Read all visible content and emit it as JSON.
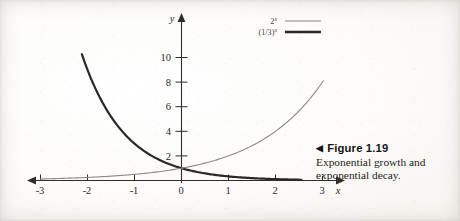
{
  "figure": {
    "marker": "◀",
    "label": "Figure 1.19",
    "caption": "Exponential growth and exponential decay."
  },
  "legend": {
    "position": "top-right",
    "entries": [
      {
        "name": "growth",
        "base": "2",
        "exponent": "x",
        "text": "2^x",
        "color": "#8c8a86",
        "width": 1.1
      },
      {
        "name": "decay",
        "base": "(1/3)",
        "exponent": "x",
        "text": "(1/3)^x",
        "color": "#2a2927",
        "width": 2.2
      }
    ]
  },
  "axes": {
    "x_label": "x",
    "y_label": "y",
    "x_ticks": [
      "-3",
      "-2",
      "-1",
      "0",
      "1",
      "2",
      "3"
    ],
    "y_ticks": [
      "2",
      "4",
      "6",
      "8",
      "10"
    ]
  },
  "chart_data": {
    "type": "line",
    "title": "Exponential growth and exponential decay.",
    "xlabel": "x",
    "ylabel": "y",
    "xlim": [
      -3.15,
      3.25
    ],
    "ylim": [
      0,
      11.2
    ],
    "xticks": [
      -3,
      -2,
      -1,
      0,
      1,
      2,
      3
    ],
    "yticks": [
      2,
      4,
      6,
      8,
      10
    ],
    "grid": false,
    "legend": "upper right",
    "annotations": [
      "Both curves pass through (0, 1)."
    ],
    "series": [
      {
        "name": "2^x",
        "label": "2^x",
        "color": "#8c8a86",
        "linewidth": 1.1,
        "x": [
          -3,
          -2.5,
          -2,
          -1.5,
          -1,
          -0.5,
          0,
          0.5,
          1,
          1.5,
          2,
          2.5,
          3
        ],
        "y": [
          0.125,
          0.177,
          0.25,
          0.354,
          0.5,
          0.707,
          1,
          1.414,
          2,
          2.828,
          4,
          5.657,
          8
        ]
      },
      {
        "name": "(1/3)^x",
        "label": "(1/3)^x",
        "color": "#2a2927",
        "linewidth": 2.2,
        "x": [
          -2.1,
          -2,
          -1.5,
          -1,
          -0.5,
          0,
          0.5,
          1,
          1.5,
          2,
          2.5
        ],
        "y": [
          10.04,
          9,
          5.196,
          3,
          1.732,
          1,
          0.577,
          0.3333,
          0.1925,
          0.1111,
          0.0642
        ]
      }
    ]
  }
}
